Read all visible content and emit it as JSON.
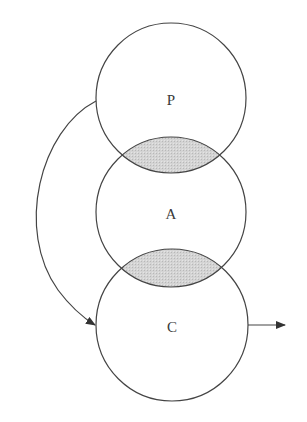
{
  "diagram": {
    "circles": [
      {
        "id": "P",
        "label": "P",
        "cx": 171,
        "cy": 98,
        "r": 75
      },
      {
        "id": "A",
        "label": "A",
        "cx": 171,
        "cy": 212,
        "r": 75
      },
      {
        "id": "C",
        "label": "C",
        "cx": 172,
        "cy": 325,
        "r": 76
      }
    ],
    "overlaps": [
      {
        "between": [
          "P",
          "A"
        ],
        "fill": "#cfcfcf"
      },
      {
        "between": [
          "A",
          "C"
        ],
        "fill": "#cfcfcf"
      }
    ],
    "arrows": [
      {
        "id": "feedback-arrow",
        "from": "P",
        "to": "C",
        "type": "curved"
      },
      {
        "id": "output-arrow",
        "from": "C",
        "to": "outside-right",
        "type": "straight"
      }
    ],
    "colors": {
      "stroke": "#444444",
      "overlap_fill": "#cfcfcf",
      "background": "#ffffff"
    }
  }
}
